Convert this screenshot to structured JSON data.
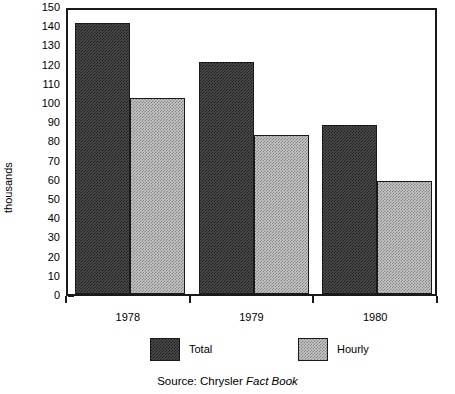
{
  "chart_data": {
    "type": "bar",
    "title": "",
    "xlabel": "",
    "ylabel": "thousands",
    "categories": [
      "1978",
      "1979",
      "1980"
    ],
    "series": [
      {
        "name": "Total",
        "values": [
          141,
          121,
          88
        ],
        "color": "#4d4d4d"
      },
      {
        "name": "Hourly",
        "values": [
          102,
          83,
          59
        ],
        "color": "#c8c8c8"
      }
    ],
    "ylim": [
      0,
      150
    ],
    "ytick_labels": [
      "150",
      "140",
      "130",
      "120",
      "110",
      "100",
      "90",
      "80",
      "70",
      "60",
      "50",
      "40",
      "30",
      "20",
      "10",
      "0"
    ],
    "ytick_values": [
      150,
      140,
      130,
      120,
      110,
      100,
      90,
      80,
      70,
      60,
      50,
      40,
      30,
      20,
      10,
      0
    ],
    "ytick_step": 10,
    "grid": false,
    "legend_position": "bottom"
  },
  "axes": {
    "y_axis_title": "thousands"
  },
  "legend": {
    "entries": [
      {
        "label": "Total"
      },
      {
        "label": "Hourly"
      }
    ]
  },
  "source": {
    "prefix": "Source: Chrysler ",
    "italic_part": "Fact Book"
  }
}
